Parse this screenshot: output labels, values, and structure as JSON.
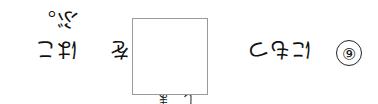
{
  "question": {
    "number": "⑥",
    "before_box": "にもつ",
    "after_box_particle": "を",
    "after_box": "はこぶ。",
    "furigana": "しま",
    "answer_box": ""
  }
}
